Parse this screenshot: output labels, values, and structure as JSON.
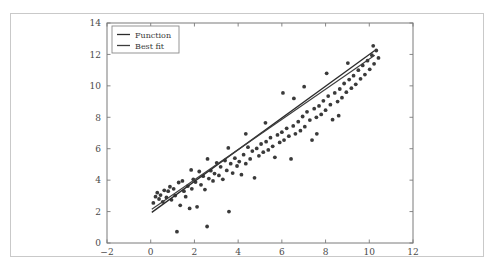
{
  "figure": {
    "background_color": "#ffffff",
    "border_color": "#c9c9c9",
    "axis_color": "#7a7a7a",
    "tick_label_color": "#4a4a4a"
  },
  "chart_data": {
    "type": "scatter",
    "title": "",
    "xlabel": "",
    "ylabel": "",
    "xlim": [
      -2,
      12
    ],
    "ylim": [
      0,
      14
    ],
    "xticks": [
      -2,
      0,
      2,
      4,
      6,
      8,
      10,
      12
    ],
    "xtick_labels": [
      "−2",
      "0",
      "2",
      "4",
      "6",
      "8",
      "10",
      "12"
    ],
    "yticks": [
      0,
      2,
      4,
      6,
      8,
      10,
      12,
      14
    ],
    "ytick_labels": [
      "0",
      "2",
      "4",
      "6",
      "8",
      "10",
      "12",
      "14"
    ],
    "grid": false,
    "legend": {
      "position": "upper left",
      "entries": [
        {
          "label": "Function",
          "color": "#2b2b2b",
          "style": "line"
        },
        {
          "label": "Best fit",
          "color": "#3c3c3c",
          "style": "line"
        }
      ]
    },
    "series": [
      {
        "name": "Function",
        "type": "line",
        "color": "#2b2b2b",
        "width": 1.3,
        "x": [
          0.05,
          10.25
        ],
        "y": [
          1.95,
          12.25
        ]
      },
      {
        "name": "Best fit",
        "type": "line",
        "color": "#3c3c3c",
        "width": 1.1,
        "x": [
          0.05,
          10.25
        ],
        "y": [
          2.15,
          11.95
        ]
      },
      {
        "name": "Samples",
        "type": "scatter",
        "color": "#3a3a3a",
        "marker_size": 1.9,
        "points": [
          [
            0.12,
            2.55
          ],
          [
            0.22,
            2.95
          ],
          [
            0.3,
            3.2
          ],
          [
            0.38,
            2.8
          ],
          [
            0.45,
            3.05
          ],
          [
            0.55,
            2.62
          ],
          [
            0.62,
            3.35
          ],
          [
            0.72,
            2.9
          ],
          [
            0.8,
            3.3
          ],
          [
            0.88,
            3.58
          ],
          [
            0.95,
            2.75
          ],
          [
            1.05,
            3.45
          ],
          [
            1.12,
            3.02
          ],
          [
            1.2,
            0.72
          ],
          [
            1.28,
            3.85
          ],
          [
            1.35,
            2.4
          ],
          [
            1.45,
            3.95
          ],
          [
            1.52,
            3.3
          ],
          [
            1.6,
            2.95
          ],
          [
            1.7,
            3.62
          ],
          [
            1.78,
            2.2
          ],
          [
            1.88,
            3.45
          ],
          [
            1.95,
            4.05
          ],
          [
            2.05,
            3.88
          ],
          [
            2.12,
            2.3
          ],
          [
            2.22,
            4.55
          ],
          [
            2.3,
            3.7
          ],
          [
            2.4,
            4.25
          ],
          [
            2.48,
            3.4
          ],
          [
            2.58,
            1.05
          ],
          [
            2.66,
            4.1
          ],
          [
            2.75,
            4.6
          ],
          [
            2.85,
            3.95
          ],
          [
            2.92,
            4.42
          ],
          [
            3.02,
            5.1
          ],
          [
            3.12,
            4.3
          ],
          [
            3.2,
            4.85
          ],
          [
            3.3,
            4.05
          ],
          [
            3.4,
            5.25
          ],
          [
            3.48,
            4.62
          ],
          [
            3.58,
            2.0
          ],
          [
            3.66,
            5.05
          ],
          [
            3.75,
            4.45
          ],
          [
            3.85,
            5.4
          ],
          [
            3.95,
            4.9
          ],
          [
            4.05,
            5.18
          ],
          [
            4.15,
            4.35
          ],
          [
            4.25,
            5.62
          ],
          [
            4.35,
            5.05
          ],
          [
            4.45,
            6.1
          ],
          [
            4.55,
            5.35
          ],
          [
            4.65,
            5.85
          ],
          [
            4.75,
            4.15
          ],
          [
            4.85,
            6.02
          ],
          [
            4.95,
            5.55
          ],
          [
            5.05,
            6.3
          ],
          [
            5.15,
            5.78
          ],
          [
            5.28,
            6.45
          ],
          [
            5.38,
            5.92
          ],
          [
            5.48,
            6.7
          ],
          [
            5.58,
            6.15
          ],
          [
            5.68,
            5.45
          ],
          [
            5.8,
            6.88
          ],
          [
            5.9,
            6.4
          ],
          [
            6.0,
            7.05
          ],
          [
            6.1,
            6.55
          ],
          [
            6.22,
            7.3
          ],
          [
            6.32,
            6.8
          ],
          [
            6.42,
            5.35
          ],
          [
            6.52,
            7.45
          ],
          [
            6.62,
            6.95
          ],
          [
            6.75,
            7.72
          ],
          [
            6.85,
            7.15
          ],
          [
            6.95,
            8.05
          ],
          [
            7.05,
            7.4
          ],
          [
            7.15,
            8.35
          ],
          [
            7.28,
            7.82
          ],
          [
            7.38,
            6.55
          ],
          [
            7.48,
            8.55
          ],
          [
            7.58,
            8.0
          ],
          [
            7.7,
            8.72
          ],
          [
            7.8,
            8.18
          ],
          [
            7.9,
            9.05
          ],
          [
            8.0,
            8.45
          ],
          [
            8.12,
            9.35
          ],
          [
            8.22,
            8.8
          ],
          [
            8.32,
            7.85
          ],
          [
            8.42,
            9.55
          ],
          [
            8.55,
            9.0
          ],
          [
            8.65,
            9.8
          ],
          [
            8.75,
            9.25
          ],
          [
            8.85,
            10.15
          ],
          [
            8.95,
            9.6
          ],
          [
            9.08,
            10.4
          ],
          [
            9.18,
            9.85
          ],
          [
            9.28,
            10.65
          ],
          [
            9.38,
            10.1
          ],
          [
            9.5,
            11.0
          ],
          [
            9.6,
            10.45
          ],
          [
            9.7,
            11.3
          ],
          [
            9.8,
            10.72
          ],
          [
            9.92,
            11.6
          ],
          [
            10.02,
            11.05
          ],
          [
            10.12,
            11.95
          ],
          [
            10.22,
            11.4
          ],
          [
            10.32,
            12.25
          ],
          [
            10.42,
            11.78
          ],
          [
            10.18,
            12.55
          ],
          [
            6.05,
            9.55
          ],
          [
            6.55,
            9.2
          ],
          [
            7.02,
            9.95
          ],
          [
            8.05,
            10.8
          ],
          [
            9.02,
            11.45
          ],
          [
            5.25,
            7.65
          ],
          [
            4.35,
            6.95
          ],
          [
            3.55,
            6.05
          ],
          [
            2.6,
            5.35
          ],
          [
            1.85,
            4.65
          ],
          [
            7.6,
            6.95
          ],
          [
            8.6,
            8.1
          ]
        ]
      }
    ]
  }
}
